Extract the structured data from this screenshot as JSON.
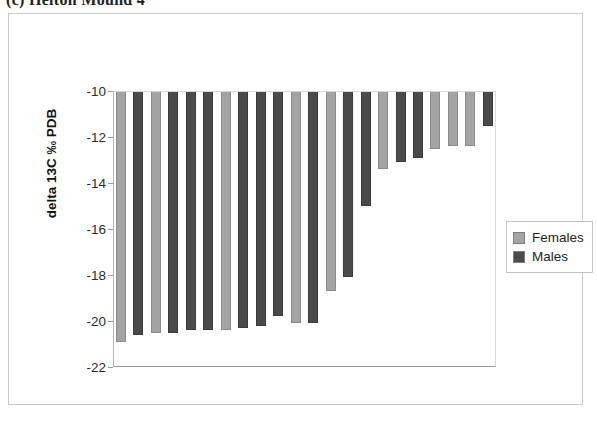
{
  "figure": {
    "caption": "(c) Helton Mound 4"
  },
  "legend": {
    "position": "right",
    "entries": [
      {
        "label": "Females",
        "color": "#a3a3a3"
      },
      {
        "label": "Males",
        "color": "#4a4a4a"
      }
    ]
  },
  "axis": {
    "y_title": "delta 13C ‰ PDB",
    "y_ticks": [
      "-10",
      "-12",
      "-14",
      "-16",
      "-18",
      "-20",
      "-22"
    ]
  },
  "chart_data": {
    "type": "bar",
    "title": "(c) Helton Mound 4",
    "xlabel": "",
    "ylabel": "delta 13C ‰ PDB",
    "ylim": [
      -22,
      -10
    ],
    "ytick_values": [
      -10,
      -12,
      -14,
      -16,
      -18,
      -20,
      -22
    ],
    "grid": false,
    "legend_position": "right",
    "orientation": "vertical-descending",
    "note": "Bars hang downward from the -10 top axis line; no x-axis tick labels are shown.",
    "categories": [
      "1",
      "2",
      "3",
      "4",
      "5",
      "6",
      "7",
      "8",
      "9",
      "10",
      "11",
      "12",
      "13",
      "14",
      "15",
      "16",
      "17",
      "18",
      "19",
      "20",
      "21",
      "22"
    ],
    "series": [
      {
        "name": "Females",
        "color": "#a3a3a3",
        "points": [
          {
            "index": 1,
            "value": -20.9
          },
          {
            "index": 3,
            "value": -20.5
          },
          {
            "index": 7,
            "value": -20.4
          },
          {
            "index": 11,
            "value": -20.1
          },
          {
            "index": 13,
            "value": -18.7
          },
          {
            "index": 16,
            "value": -13.4
          },
          {
            "index": 19,
            "value": -12.5
          },
          {
            "index": 20,
            "value": -12.4
          },
          {
            "index": 21,
            "value": -12.4
          }
        ]
      },
      {
        "name": "Males",
        "color": "#4a4a4a",
        "points": [
          {
            "index": 2,
            "value": -20.6
          },
          {
            "index": 4,
            "value": -20.5
          },
          {
            "index": 5,
            "value": -20.4
          },
          {
            "index": 6,
            "value": -20.4
          },
          {
            "index": 8,
            "value": -20.3
          },
          {
            "index": 9,
            "value": -20.2
          },
          {
            "index": 10,
            "value": -19.8
          },
          {
            "index": 12,
            "value": -20.1
          },
          {
            "index": 14,
            "value": -18.1
          },
          {
            "index": 15,
            "value": -15.0
          },
          {
            "index": 17,
            "value": -13.1
          },
          {
            "index": 18,
            "value": -12.9
          },
          {
            "index": 22,
            "value": -11.5
          }
        ]
      }
    ],
    "bars": [
      {
        "index": 1,
        "series": "Females",
        "value": -20.9
      },
      {
        "index": 2,
        "series": "Males",
        "value": -20.6
      },
      {
        "index": 3,
        "series": "Females",
        "value": -20.5
      },
      {
        "index": 4,
        "series": "Males",
        "value": -20.5
      },
      {
        "index": 5,
        "series": "Males",
        "value": -20.4
      },
      {
        "index": 6,
        "series": "Males",
        "value": -20.4
      },
      {
        "index": 7,
        "series": "Females",
        "value": -20.4
      },
      {
        "index": 8,
        "series": "Males",
        "value": -20.3
      },
      {
        "index": 9,
        "series": "Males",
        "value": -20.2
      },
      {
        "index": 10,
        "series": "Males",
        "value": -19.8
      },
      {
        "index": 11,
        "series": "Females",
        "value": -20.1
      },
      {
        "index": 12,
        "series": "Males",
        "value": -20.1
      },
      {
        "index": 13,
        "series": "Females",
        "value": -18.7
      },
      {
        "index": 14,
        "series": "Males",
        "value": -18.1
      },
      {
        "index": 15,
        "series": "Males",
        "value": -15.0
      },
      {
        "index": 16,
        "series": "Females",
        "value": -13.4
      },
      {
        "index": 17,
        "series": "Males",
        "value": -13.1
      },
      {
        "index": 18,
        "series": "Males",
        "value": -12.9
      },
      {
        "index": 19,
        "series": "Females",
        "value": -12.5
      },
      {
        "index": 20,
        "series": "Females",
        "value": -12.4
      },
      {
        "index": 21,
        "series": "Females",
        "value": -12.4
      },
      {
        "index": 22,
        "series": "Males",
        "value": -11.5
      }
    ]
  }
}
